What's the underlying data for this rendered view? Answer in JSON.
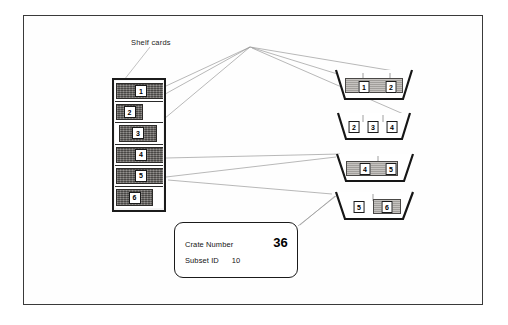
{
  "diagram": {
    "shelf_label": "Shelf cards",
    "frame": {
      "border_color": "#3a3a3a"
    },
    "stack": {
      "name": "shelf-card-stack",
      "cards": [
        {
          "number": "1",
          "left": 1,
          "width": 50
        },
        {
          "number": "2",
          "left": 1,
          "width": 27
        },
        {
          "number": "3",
          "left": 4,
          "width": 38
        },
        {
          "number": "4",
          "left": 1,
          "width": 50
        },
        {
          "number": "5",
          "left": 1,
          "width": 50
        },
        {
          "number": "6",
          "left": 1,
          "width": 37
        }
      ]
    },
    "crates": [
      {
        "name": "crate-1",
        "left": 333,
        "top": 66,
        "width": 82,
        "height": 38,
        "cards": [
          {
            "number": "1",
            "cx": 31,
            "cy": 21
          },
          {
            "number": "2",
            "cx": 58,
            "cy": 21
          }
        ]
      },
      {
        "name": "crate-2",
        "left": 334,
        "top": 110,
        "width": 82,
        "height": 34,
        "cards": [
          {
            "number": "2",
            "cx": 20,
            "cy": 17
          },
          {
            "number": "3",
            "cx": 39,
            "cy": 17
          },
          {
            "number": "4",
            "cx": 58,
            "cy": 17
          }
        ]
      },
      {
        "name": "crate-3",
        "left": 333,
        "top": 150,
        "width": 84,
        "height": 36,
        "cards": [
          {
            "number": "4",
            "cx": 32,
            "cy": 19
          },
          {
            "number": "5",
            "cx": 58,
            "cy": 19
          }
        ]
      },
      {
        "name": "crate-4",
        "left": 331,
        "top": 188,
        "width": 88,
        "height": 36,
        "cards": [
          {
            "number": "5",
            "cx": 28,
            "cy": 19
          },
          {
            "number": "6",
            "cx": 56,
            "cy": 19
          }
        ]
      }
    ],
    "info_box": {
      "crate_number_label": "Crate Number",
      "crate_number_value": "36",
      "subset_id_label": "Subset ID",
      "subset_id_value": "10"
    },
    "connectors": {
      "line_color": "#8e8e8e",
      "hub": {
        "x": 250,
        "y": 47
      }
    }
  }
}
